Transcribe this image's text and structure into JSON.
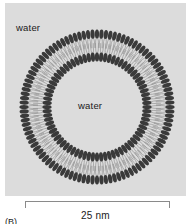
{
  "figure": {
    "caption": "(B)",
    "panel_background": "#dcdcdc",
    "labels": {
      "water_outer": "water",
      "water_inner": "water"
    },
    "scale": {
      "value": "25 nm",
      "bar_length_px": 145
    },
    "diagram": {
      "type": "liposome-cross-section",
      "center": {
        "x": 92,
        "y": 104
      },
      "outer_head_radius": 73,
      "inner_head_radius": 50,
      "head_color": "#3a3a3a",
      "tail_color": "#9a9a9a",
      "lipid_count_outer": 104,
      "lipid_count_inner": 76,
      "head_rx": 2.1,
      "head_ry": 4.6
    }
  }
}
